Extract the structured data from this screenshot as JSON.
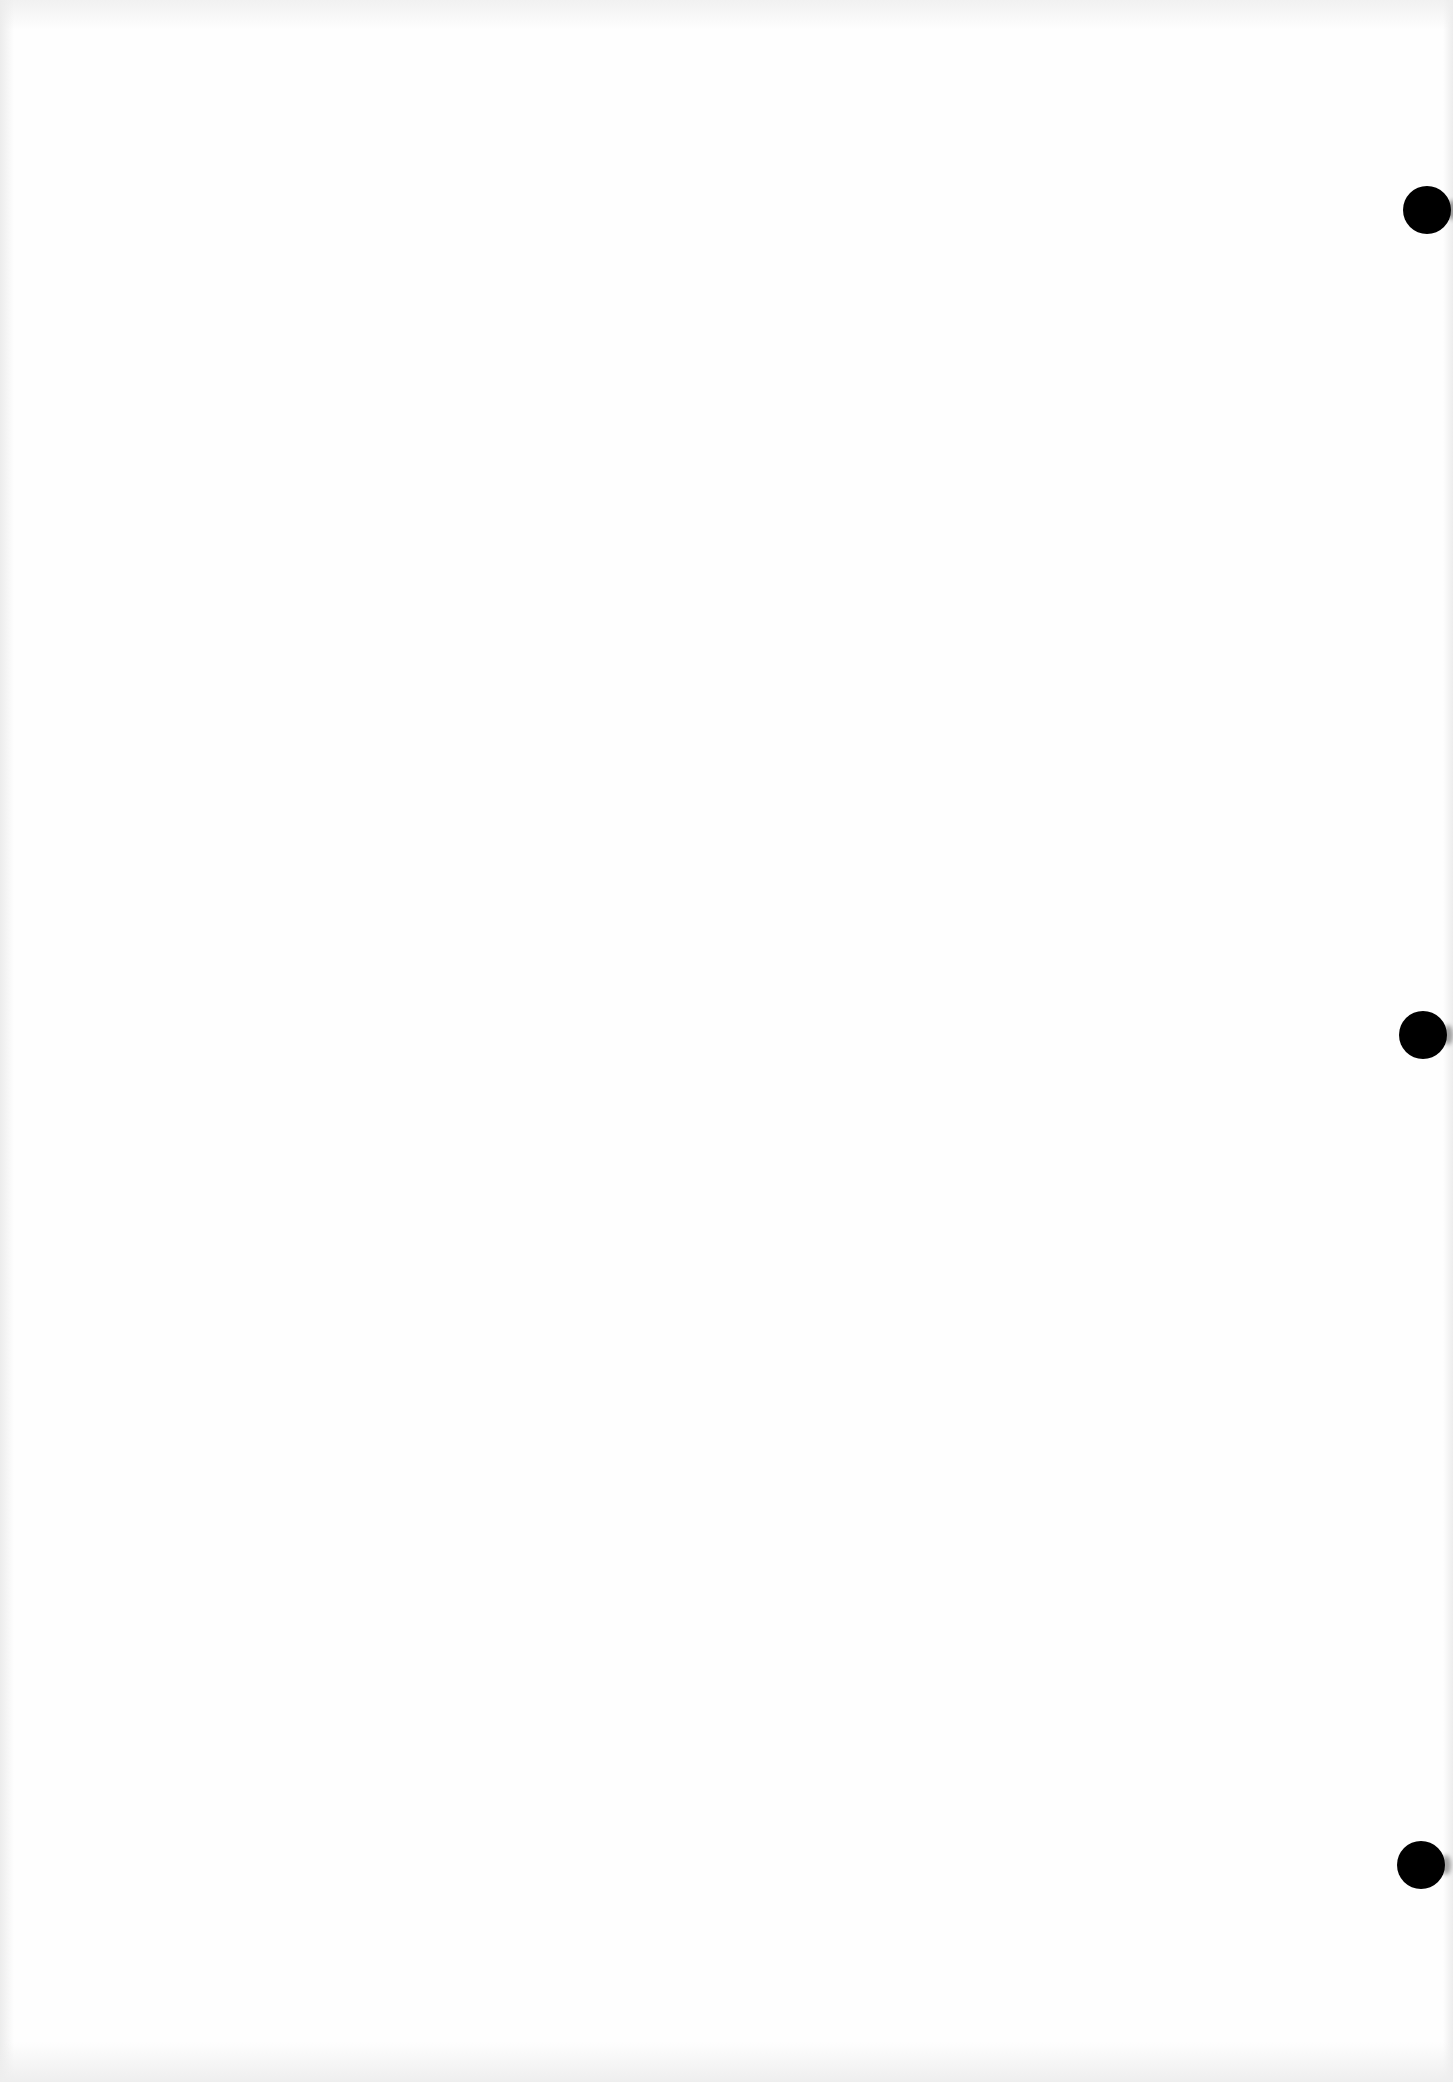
{
  "document": {
    "type": "blank-scanned-page",
    "background_color": "#fefefe",
    "text_content": "",
    "punch_holes": [
      {
        "x": 1403,
        "y": 186,
        "diameter": 48,
        "color": "#000000"
      },
      {
        "x": 1399,
        "y": 1011,
        "diameter": 48,
        "color": "#000000"
      },
      {
        "x": 1397,
        "y": 1841,
        "diameter": 48,
        "color": "#000000"
      }
    ]
  }
}
